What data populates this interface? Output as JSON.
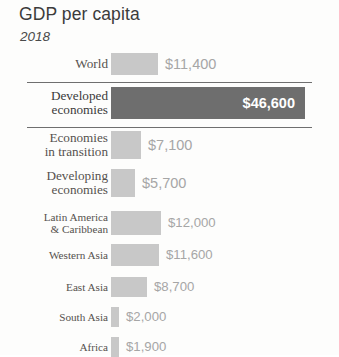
{
  "header": {
    "title": "GDP per capita",
    "subtitle": "2018"
  },
  "chart_data": {
    "type": "bar",
    "title": "GDP per capita",
    "subtitle": "2018",
    "orientation": "horizontal",
    "xlabel": "",
    "ylabel": "",
    "grid": false,
    "legend": false,
    "axis_visible": false,
    "value_unit": "USD",
    "xlim": [
      0,
      46600
    ],
    "categories": [
      "World",
      "Developed economies",
      "Economies in transition",
      "Developing economies",
      "Latin America & Caribbean",
      "Western Asia",
      "East Asia",
      "South Asia",
      "Africa"
    ],
    "values": [
      11400,
      46600,
      7100,
      5700,
      12000,
      11600,
      8700,
      2000,
      1900
    ],
    "value_labels": [
      "$11,400",
      "$46,600",
      "$7,100",
      "$5,700",
      "$12,000",
      "$11,600",
      "$8,700",
      "$2,000",
      "$1,900"
    ],
    "highlight_index": 1,
    "colors": {
      "bar": "#c8c8c8",
      "bar_highlight": "#6e6e6e",
      "value_label": "#a6a6a6",
      "value_label_highlight": "#ffffff",
      "category_label": "#55514e",
      "rule": "#6f6f6f"
    }
  },
  "rows": [
    {
      "label": "World",
      "label_size": "big",
      "value": "$11,400",
      "amount": 11400,
      "highlight": false
    },
    {
      "label": "Developed\neconomies",
      "label_size": "big",
      "value": "$46,600",
      "amount": 46600,
      "highlight": true
    },
    {
      "label": "Economies\nin transition",
      "label_size": "big",
      "value": "$7,100",
      "amount": 7100,
      "highlight": false
    },
    {
      "label": "Developing\neconomies",
      "label_size": "big",
      "value": "$5,700",
      "amount": 5700,
      "highlight": false
    },
    {
      "label": "Latin America\n& Caribbean",
      "label_size": "small",
      "value": "$12,000",
      "amount": 12000,
      "highlight": false
    },
    {
      "label": "Western Asia",
      "label_size": "small",
      "value": "$11,600",
      "amount": 11600,
      "highlight": false
    },
    {
      "label": "East Asia",
      "label_size": "small",
      "value": "$8,700",
      "amount": 8700,
      "highlight": false
    },
    {
      "label": "South Asia",
      "label_size": "small",
      "value": "$2,000",
      "amount": 2000,
      "highlight": false
    },
    {
      "label": "Africa",
      "label_size": "small",
      "value": "$1,900",
      "amount": 1900,
      "highlight": false
    }
  ]
}
